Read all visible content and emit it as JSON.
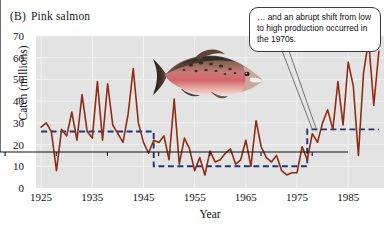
{
  "figure": {
    "panel_letter": "(B)",
    "panel_title": "Pink salmon"
  },
  "callout": {
    "text": "… and an abrupt shift from low to high production occurred in the 1970s."
  },
  "photo": {
    "name": "pink-salmon-photo",
    "alt": "Photograph of a spawning male pink salmon"
  },
  "colors": {
    "series_line": "#8f2d14",
    "step_line": "#22357a",
    "plot_background": "#e3e3e3",
    "gridline": "#f2f2f2",
    "axis": "#111111",
    "callout_border": "#3a3a3a",
    "callout_background": "#ffffff"
  },
  "chart_data": {
    "type": "line",
    "xlabel": "Year",
    "ylabel": "Catch (millions)",
    "xlim": [
      1924,
      1992
    ],
    "ylim": [
      0,
      70
    ],
    "yticks": [
      0,
      10,
      20,
      30,
      40,
      50,
      60,
      70
    ],
    "xticks": [
      1925,
      1935,
      1945,
      1955,
      1965,
      1975,
      1985
    ],
    "grid": true,
    "legend": "none",
    "annotations": [
      {
        "text": "… and an abrupt shift from low to high production occurred in the 1970s.",
        "points_to_year": 1978,
        "points_to_value": 27
      }
    ],
    "series": [
      {
        "name": "Catch (millions)",
        "style": "solid",
        "color": "#8f2d14",
        "x": [
          1925,
          1926,
          1927,
          1928,
          1929,
          1930,
          1931,
          1932,
          1933,
          1934,
          1935,
          1936,
          1937,
          1938,
          1939,
          1940,
          1941,
          1942,
          1943,
          1944,
          1945,
          1946,
          1947,
          1948,
          1949,
          1950,
          1951,
          1952,
          1953,
          1954,
          1955,
          1956,
          1957,
          1958,
          1959,
          1960,
          1961,
          1962,
          1963,
          1964,
          1965,
          1966,
          1967,
          1968,
          1969,
          1970,
          1971,
          1972,
          1973,
          1974,
          1975,
          1976,
          1977,
          1978,
          1979,
          1980,
          1981,
          1982,
          1983,
          1984,
          1985,
          1986,
          1987,
          1988,
          1989,
          1990,
          1991
        ],
        "y": [
          28,
          30,
          26,
          8,
          27,
          24,
          35,
          22,
          43,
          26,
          23,
          49,
          22,
          48,
          29,
          25,
          21,
          34,
          55,
          30,
          21,
          16,
          22,
          21,
          24,
          13,
          41,
          11,
          23,
          18,
          8,
          14,
          6,
          17,
          12,
          13,
          16,
          18,
          11,
          13,
          22,
          10,
          31,
          19,
          14,
          12,
          15,
          8,
          6,
          7,
          7,
          19,
          13,
          25,
          21,
          30,
          36,
          27,
          49,
          29,
          58,
          47,
          15,
          53,
          68,
          38,
          63
        ]
      },
      {
        "name": "Regime shift mean",
        "style": "dashed",
        "color": "#22357a",
        "type": "step",
        "segments": [
          {
            "start_year": 1925,
            "end_year": 1947,
            "value": 26
          },
          {
            "start_year": 1947,
            "end_year": 1977,
            "value": 10
          },
          {
            "start_year": 1977,
            "end_year": 1991,
            "value": 27
          }
        ]
      }
    ]
  }
}
